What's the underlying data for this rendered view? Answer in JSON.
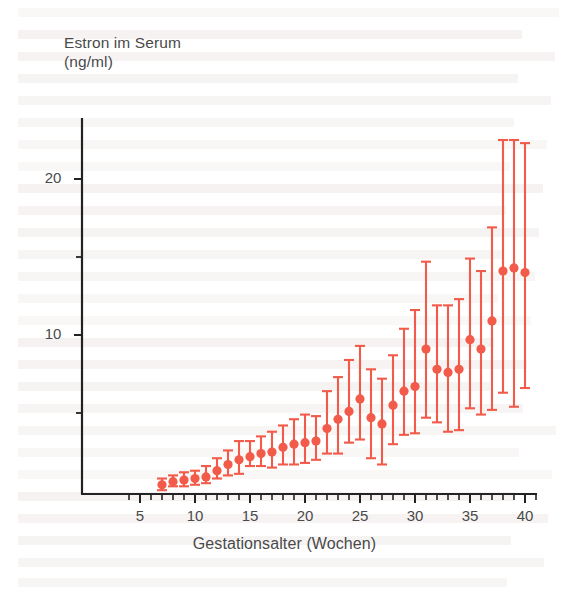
{
  "chart_data": {
    "type": "scatter",
    "title": "Estron im Serum",
    "subtitle": "(ng/ml)",
    "xlabel": "Gestationsalter (Wochen)",
    "ylabel": "Estron im Serum (ng/ml)",
    "xlim": [
      3.6,
      41.2
    ],
    "ylim": [
      0,
      23.5
    ],
    "grid": false,
    "legend": null,
    "series_color": "#f25a4a",
    "marker": "filled-circle-with-vertical-error-bar",
    "x_ticks_major": [
      5,
      10,
      15,
      20,
      25,
      30,
      35,
      40
    ],
    "x_tick_labels": [
      "5",
      "10",
      "15",
      "20",
      "25",
      "30",
      "35",
      "40"
    ],
    "x_ticks_minor_step": 1,
    "y_ticks_major": [
      10,
      20
    ],
    "y_tick_labels": [
      "10",
      "20"
    ],
    "y_ticks_minor": [
      5,
      15
    ],
    "xlabel_text": "Gestationsalter (Wochen)",
    "x": [
      7,
      8,
      9,
      10,
      11,
      12,
      13,
      14,
      15,
      16,
      17,
      18,
      19,
      20,
      21,
      22,
      23,
      24,
      25,
      26,
      27,
      28,
      29,
      30,
      31,
      32,
      33,
      34,
      35,
      36,
      37,
      38,
      39,
      40
    ],
    "values": [
      0.4,
      0.6,
      0.7,
      0.8,
      0.9,
      1.3,
      1.7,
      2.0,
      2.2,
      2.4,
      2.5,
      2.8,
      3.0,
      3.1,
      3.2,
      4.0,
      4.6,
      5.1,
      5.9,
      4.7,
      4.3,
      5.5,
      6.4,
      6.7,
      9.1,
      7.8,
      7.6,
      7.8,
      9.7,
      9.1,
      10.9,
      14.1,
      14.3,
      14.0
    ],
    "err_low": [
      0.4,
      0.3,
      0.4,
      0.4,
      0.4,
      0.5,
      0.7,
      0.9,
      0.6,
      0.8,
      1.0,
      1.1,
      1.3,
      1.3,
      1.2,
      1.6,
      2.2,
      2.0,
      2.6,
      2.6,
      2.6,
      2.5,
      2.8,
      3.0,
      4.4,
      3.4,
      3.8,
      3.9,
      4.4,
      4.2,
      5.7,
      7.8,
      8.9,
      7.4
    ],
    "err_high": [
      0.4,
      0.4,
      0.5,
      0.5,
      0.7,
      0.8,
      0.9,
      1.2,
      1.0,
      1.1,
      1.3,
      1.4,
      1.6,
      1.8,
      1.6,
      2.4,
      2.7,
      3.3,
      3.4,
      3.1,
      2.9,
      3.2,
      4.0,
      4.9,
      5.6,
      4.1,
      4.3,
      4.5,
      5.2,
      5.0,
      6.0,
      8.4,
      8.2,
      8.3
    ],
    "note": "Mittelwert mit Streubereich je Gestationswoche"
  },
  "axes": {
    "y_title_line1": "Estron im Serum",
    "y_title_line2": "(ng/ml)",
    "x_title": "Gestationsalter (Wochen)"
  }
}
